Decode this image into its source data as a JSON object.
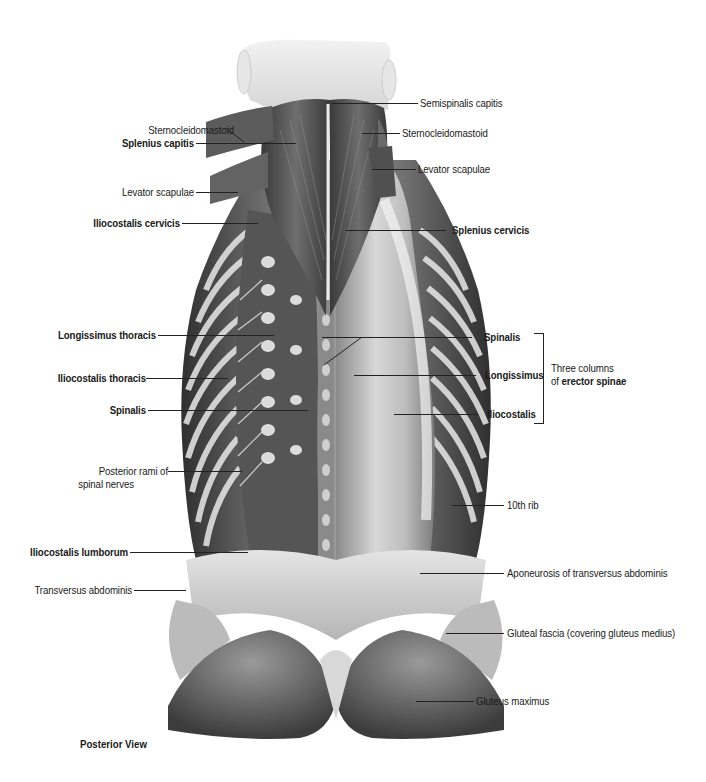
{
  "figure": {
    "view_caption": "Posterior View"
  },
  "labels_left": [
    {
      "id": "sternocleidomastoid-left",
      "text": "Sternocleidomastoid",
      "bold": false
    },
    {
      "id": "splenius-capitis",
      "text": "Splenius capitis",
      "bold": true
    },
    {
      "id": "levator-scapulae-left",
      "text": "Levator scapulae",
      "bold": false
    },
    {
      "id": "iliocostalis-cervicis",
      "text": "Iliocostalis cervicis",
      "bold": true
    },
    {
      "id": "longissimus-thoracis",
      "text": "Longissimus thoracis",
      "bold": true
    },
    {
      "id": "iliocostalis-thoracis",
      "text": "Iliocostalis thoracis",
      "bold": true
    },
    {
      "id": "spinalis-left",
      "text": "Spinalis",
      "bold": true
    },
    {
      "id": "posterior-rami",
      "text": "Posterior rami of",
      "text2": "spinal nerves",
      "bold": false
    },
    {
      "id": "iliocostalis-lumborum",
      "text": "Iliocostalis lumborum",
      "bold": true
    },
    {
      "id": "transversus-abdominis",
      "text": "Transversus abdominis",
      "bold": false
    }
  ],
  "labels_right": [
    {
      "id": "semispinalis-capitis",
      "text": "Semispinalis capitis",
      "bold": false
    },
    {
      "id": "sternocleidomastoid-right",
      "text": "Sternocleidomastoid",
      "bold": false
    },
    {
      "id": "levator-scapulae-right",
      "text": "Levator scapulae",
      "bold": false
    },
    {
      "id": "splenius-cervicis",
      "text": "Splenius cervicis",
      "bold": true
    },
    {
      "id": "spinalis-right",
      "text": "Spinalis",
      "bold": true
    },
    {
      "id": "longissimus",
      "text": "Longissimus",
      "bold": true
    },
    {
      "id": "iliocostalis",
      "text": "Iliocostalis",
      "bold": true
    },
    {
      "id": "tenth-rib",
      "text": "10th rib",
      "bold": false
    },
    {
      "id": "aponeurosis-transversus",
      "text": "Aponeurosis of transversus abdominis",
      "bold": false
    },
    {
      "id": "gluteal-fascia",
      "text": "Gluteal fascia (covering gluteus medius)",
      "bold": false
    },
    {
      "id": "gluteus-maximus",
      "text": "Gluteus maximus",
      "bold": false
    }
  ],
  "bracket_group": {
    "line1": "Three columns",
    "line2_prefix": "of ",
    "line2_bold": "erector spinae"
  }
}
